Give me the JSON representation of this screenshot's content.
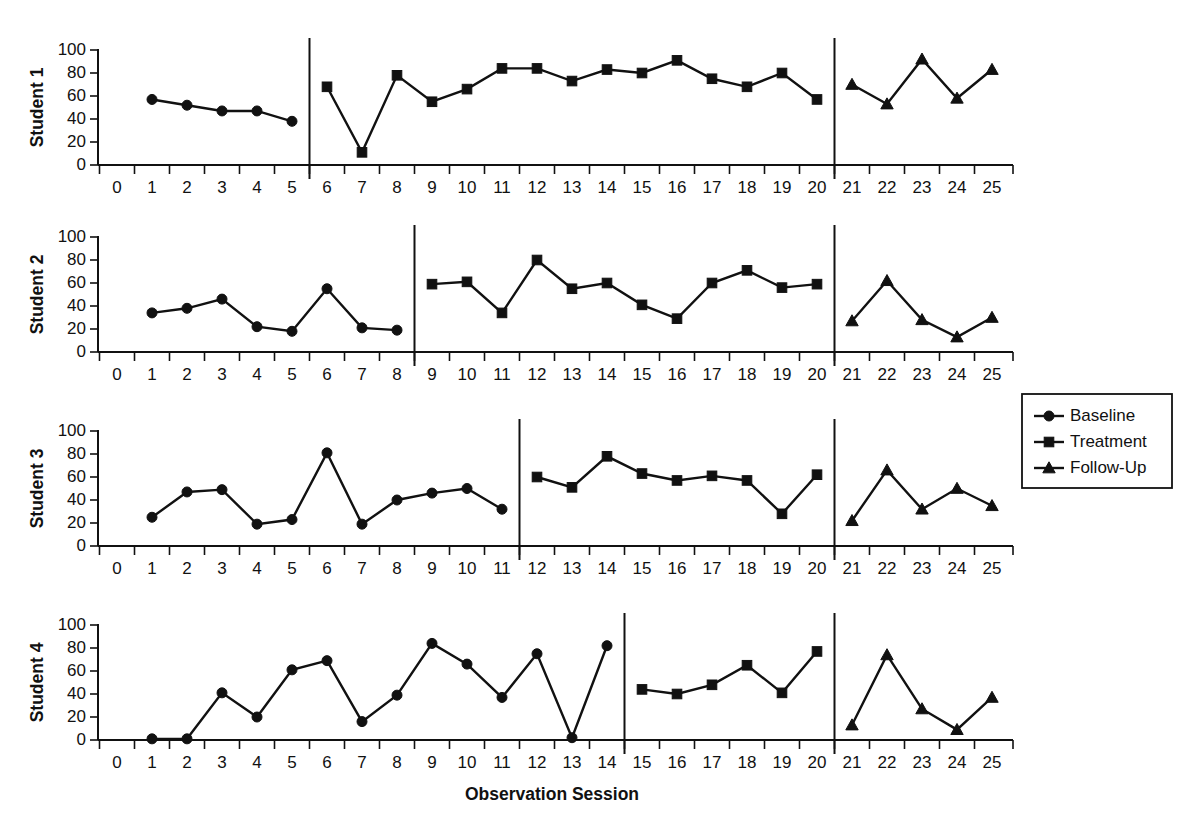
{
  "figure": {
    "xlabel": "Observation Session",
    "legend": {
      "position": "right-middle",
      "entries": [
        {
          "label": "Baseline",
          "marker": "circle"
        },
        {
          "label": "Treatment",
          "marker": "square"
        },
        {
          "label": "Follow-Up",
          "marker": "triangle"
        }
      ]
    }
  },
  "chart_data": {
    "type": "line",
    "title": "",
    "subtitle": "",
    "xlabel": "Observation Session",
    "ylabel": "",
    "xlim": [
      0,
      25
    ],
    "ylim": [
      0,
      100
    ],
    "xticks": [
      0,
      1,
      2,
      3,
      4,
      5,
      6,
      7,
      8,
      9,
      10,
      11,
      12,
      13,
      14,
      15,
      16,
      17,
      18,
      19,
      20,
      21,
      22,
      23,
      24,
      25
    ],
    "yticks": [
      0,
      20,
      40,
      60,
      80,
      100
    ],
    "grid": false,
    "legend_entries": [
      "Baseline",
      "Treatment",
      "Follow-Up"
    ],
    "legend_position": "right",
    "design": "multiple-baseline across participants",
    "panels": [
      {
        "name": "Student 1",
        "ylabel": "Student 1",
        "phase_lines": [
          5.5,
          20.5
        ],
        "series": [
          {
            "name": "Baseline",
            "marker": "circle",
            "x": [
              1,
              2,
              3,
              4,
              5
            ],
            "values": [
              57,
              52,
              47,
              47,
              38
            ]
          },
          {
            "name": "Treatment",
            "marker": "square",
            "x": [
              6,
              7,
              8,
              9,
              10,
              11,
              12,
              13,
              14,
              15,
              16,
              17,
              18,
              19,
              20
            ],
            "values": [
              68,
              11,
              78,
              55,
              66,
              84,
              84,
              73,
              83,
              80,
              91,
              75,
              68,
              80,
              57
            ]
          },
          {
            "name": "Follow-Up",
            "marker": "triangle",
            "x": [
              21,
              22,
              23,
              24,
              25
            ],
            "values": [
              70,
              53,
              92,
              58,
              83
            ]
          }
        ]
      },
      {
        "name": "Student 2",
        "ylabel": "Student 2",
        "phase_lines": [
          8.5,
          20.5
        ],
        "series": [
          {
            "name": "Baseline",
            "marker": "circle",
            "x": [
              1,
              2,
              3,
              4,
              5,
              6,
              7,
              8
            ],
            "values": [
              34,
              38,
              46,
              22,
              18,
              55,
              21,
              19
            ]
          },
          {
            "name": "Treatment",
            "marker": "square",
            "x": [
              9,
              10,
              11,
              12,
              13,
              14,
              15,
              16,
              17,
              18,
              19,
              20
            ],
            "values": [
              59,
              61,
              34,
              80,
              55,
              60,
              41,
              29,
              60,
              71,
              56,
              59
            ]
          },
          {
            "name": "Follow-Up",
            "marker": "triangle",
            "x": [
              21,
              22,
              23,
              24,
              25
            ],
            "values": [
              27,
              62,
              28,
              13,
              30
            ]
          }
        ]
      },
      {
        "name": "Student 3",
        "ylabel": "Student 3",
        "phase_lines": [
          11.5,
          20.5
        ],
        "series": [
          {
            "name": "Baseline",
            "marker": "circle",
            "x": [
              1,
              2,
              3,
              4,
              5,
              6,
              7,
              8,
              9,
              10,
              11
            ],
            "values": [
              25,
              47,
              49,
              19,
              23,
              81,
              19,
              40,
              46,
              50,
              32
            ]
          },
          {
            "name": "Treatment",
            "marker": "square",
            "x": [
              12,
              13,
              14,
              15,
              16,
              17,
              18,
              19,
              20
            ],
            "values": [
              60,
              51,
              78,
              63,
              57,
              61,
              57,
              28,
              62
            ]
          },
          {
            "name": "Follow-Up",
            "marker": "triangle",
            "x": [
              21,
              22,
              23,
              24,
              25
            ],
            "values": [
              22,
              66,
              32,
              50,
              35
            ]
          }
        ]
      },
      {
        "name": "Student 4",
        "ylabel": "Student 4",
        "phase_lines": [
          14.5,
          20.5
        ],
        "series": [
          {
            "name": "Baseline",
            "marker": "circle",
            "x": [
              1,
              2,
              3,
              4,
              5,
              6,
              7,
              8,
              9,
              10,
              11,
              12,
              13,
              14
            ],
            "values": [
              1,
              1,
              41,
              20,
              61,
              69,
              16,
              39,
              84,
              66,
              37,
              75,
              2,
              82
            ]
          },
          {
            "name": "Treatment",
            "marker": "square",
            "x": [
              15,
              16,
              17,
              18,
              19,
              20
            ],
            "values": [
              44,
              40,
              48,
              65,
              41,
              77
            ]
          },
          {
            "name": "Follow-Up",
            "marker": "triangle",
            "x": [
              21,
              22,
              23,
              24,
              25
            ],
            "values": [
              13,
              74,
              27,
              9,
              37
            ]
          }
        ]
      }
    ]
  }
}
